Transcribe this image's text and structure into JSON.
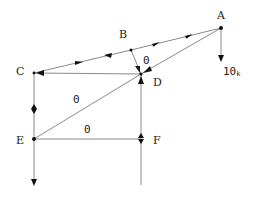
{
  "diagram": {
    "type": "truss",
    "joints": [
      {
        "id": "A",
        "label": "A",
        "x": 221,
        "y": 28
      },
      {
        "id": "B",
        "label": "B",
        "x": 131,
        "y": 50
      },
      {
        "id": "C",
        "label": "C",
        "x": 34,
        "y": 73
      },
      {
        "id": "D",
        "label": "D",
        "x": 141,
        "y": 74
      },
      {
        "id": "E",
        "label": "E",
        "x": 34,
        "y": 139
      },
      {
        "id": "F",
        "label": "F",
        "x": 141,
        "y": 139
      }
    ],
    "members": [
      {
        "from": "A",
        "to": "B",
        "force_label": ""
      },
      {
        "from": "B",
        "to": "C",
        "force_label": ""
      },
      {
        "from": "B",
        "to": "D",
        "force_label": "0"
      },
      {
        "from": "A",
        "to": "D",
        "force_label": ""
      },
      {
        "from": "C",
        "to": "D",
        "force_label": ""
      },
      {
        "from": "C",
        "to": "E",
        "force_label": ""
      },
      {
        "from": "E",
        "to": "D",
        "force_label": "0"
      },
      {
        "from": "E",
        "to": "F",
        "force_label": "0"
      },
      {
        "from": "D",
        "to": "F",
        "force_label": ""
      }
    ],
    "zero_labels": {
      "bd": "0",
      "ed": "0",
      "ef": "0"
    },
    "load": {
      "joint": "A",
      "value": "10",
      "unit": "k",
      "direction": "down"
    }
  }
}
